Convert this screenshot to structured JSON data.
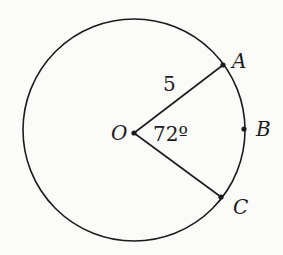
{
  "diagram": {
    "type": "circle-sector",
    "center": {
      "label": "O",
      "x": 134,
      "y": 133
    },
    "radius_px": 112,
    "radius_label": "5",
    "angle_label": "72º",
    "points": [
      {
        "label": "A",
        "x": 223,
        "y": 65
      },
      {
        "label": "B",
        "x": 244,
        "y": 129
      },
      {
        "label": "C",
        "x": 221,
        "y": 197
      }
    ],
    "colors": {
      "stroke": "#1c1c1c",
      "background": "#fbfbf9"
    }
  }
}
